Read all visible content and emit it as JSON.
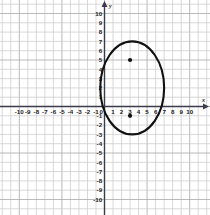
{
  "chart_data": {
    "type": "scatter",
    "title": "",
    "xlabel": "x",
    "ylabel": "y",
    "xlim": [
      -10.5,
      10.5
    ],
    "ylim": [
      -10.5,
      10.5
    ],
    "grid": true,
    "grid_step": 1,
    "legend": "none",
    "x_tick_labels": [
      "-10",
      "-9",
      "-8",
      "-7",
      "-6",
      "-5",
      "-4",
      "-3",
      "-2",
      "-1",
      "1",
      "2",
      "3",
      "4",
      "5",
      "6",
      "7",
      "8",
      "9",
      "10"
    ],
    "x_tick_values": [
      -10,
      -9,
      -8,
      -7,
      -6,
      -5,
      -4,
      -3,
      -2,
      -1,
      1,
      2,
      3,
      4,
      5,
      6,
      7,
      8,
      9,
      10
    ],
    "y_tick_labels": [
      "10",
      "9",
      "8",
      "7",
      "6",
      "5",
      "4",
      "3",
      "2",
      "1",
      "-1",
      "-2",
      "-3",
      "-4",
      "-5",
      "-6",
      "-7",
      "-8",
      "-9",
      "-10"
    ],
    "y_tick_values": [
      10,
      9,
      8,
      7,
      6,
      5,
      4,
      3,
      2,
      1,
      -1,
      -2,
      -3,
      -4,
      -5,
      -6,
      -7,
      -8,
      -9,
      -10
    ],
    "origin_label": "0",
    "axis_color": "#3b3b4a",
    "grid_color": "#c9c9c9",
    "curve_color": "#111111",
    "point_color": "#111111",
    "shapes": [
      {
        "name": "ellipse",
        "type": "ellipse",
        "center_x": 3.25,
        "center_y": 2,
        "radius_x": 3.75,
        "radius_y": 5,
        "stroke": "#111111",
        "fill": "none"
      }
    ],
    "points": [
      {
        "name": "upper-point",
        "x": 3,
        "y": 5,
        "label": ""
      },
      {
        "name": "lower-point",
        "x": 3,
        "y": -1,
        "label": ""
      }
    ]
  }
}
